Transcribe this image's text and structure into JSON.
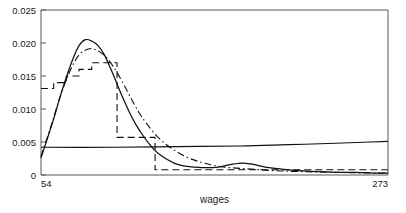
{
  "chart_data": {
    "type": "line",
    "title": "",
    "xlabel": "wages",
    "ylabel": "",
    "xlim": [
      54,
      273
    ],
    "ylim": [
      0,
      0.025
    ],
    "grid": false,
    "legend": "none",
    "xticks": [
      54,
      273
    ],
    "xticklabels": [
      "54",
      "273"
    ],
    "yticks": [
      0,
      0.005,
      0.01,
      0.015,
      0.02,
      0.025
    ],
    "yticklabels": [
      "0",
      "0.005",
      "0.010",
      "0.015",
      "0.020",
      "0.025"
    ],
    "series": [
      {
        "name": "kernel-density-estimate",
        "style": "solid",
        "color": "#111111",
        "x": [
          54,
          58,
          62,
          66,
          70,
          74,
          78,
          82,
          86,
          90,
          94,
          98,
          102,
          106,
          110,
          114,
          118,
          122,
          126,
          130,
          134,
          138,
          142,
          146,
          150,
          158,
          166,
          174,
          182,
          190,
          198,
          206,
          214,
          222,
          230,
          240,
          252,
          264,
          273
        ],
        "y": [
          0.0026,
          0.0055,
          0.0085,
          0.0118,
          0.0148,
          0.0175,
          0.0196,
          0.0205,
          0.0203,
          0.0196,
          0.0182,
          0.0161,
          0.0138,
          0.0115,
          0.0094,
          0.0076,
          0.0061,
          0.0048,
          0.0037,
          0.0029,
          0.0023,
          0.0018,
          0.0015,
          0.0013,
          0.0012,
          0.0011,
          0.0012,
          0.0016,
          0.0018,
          0.0015,
          0.0011,
          0.0009,
          0.0007,
          0.0006,
          0.0005,
          0.0004,
          0.0004,
          0.0003,
          0.0003
        ]
      },
      {
        "name": "smooth-comparison-estimate",
        "style": "dashdot",
        "color": "#111111",
        "x": [
          54,
          60,
          66,
          72,
          78,
          84,
          88,
          92,
          96,
          100,
          104,
          108,
          112,
          116,
          120,
          126,
          132,
          138,
          146,
          154,
          162,
          170,
          180,
          192,
          206,
          222,
          240,
          260,
          273
        ],
        "y": [
          0.0028,
          0.0072,
          0.0118,
          0.0156,
          0.0182,
          0.0191,
          0.019,
          0.0185,
          0.0176,
          0.0163,
          0.0147,
          0.0129,
          0.0111,
          0.0094,
          0.008,
          0.0062,
          0.0048,
          0.0038,
          0.0027,
          0.002,
          0.0015,
          0.0012,
          0.001,
          0.0008,
          0.0006,
          0.0005,
          0.0004,
          0.0003,
          0.0003
        ]
      },
      {
        "name": "histogram-step-estimate",
        "style": "dashed",
        "color": "#111111",
        "x": [
          54,
          62,
          70,
          78,
          86,
          94,
          102,
          110,
          118,
          126,
          134,
          150,
          170,
          200,
          240,
          273
        ],
        "y": [
          0.0131,
          0.014,
          0.015,
          0.016,
          0.017,
          0.017,
          0.0057,
          0.0057,
          0.0057,
          0.0008,
          0.0008,
          0.0008,
          0.0008,
          0.0008,
          0.0008,
          0.0008
        ],
        "note": "piecewise-constant step function with long-dash stroke"
      },
      {
        "name": "baseline-reference-line",
        "style": "solid",
        "color": "#111111",
        "x": [
          54,
          100,
          140,
          180,
          210,
          240,
          262,
          273
        ],
        "y": [
          0.0042,
          0.0042,
          0.0043,
          0.0044,
          0.0046,
          0.0048,
          0.005,
          0.0051
        ]
      }
    ]
  }
}
